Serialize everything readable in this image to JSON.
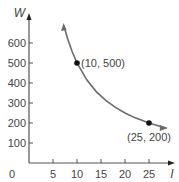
{
  "chart_data": {
    "type": "line",
    "title": "",
    "xlabel": "I",
    "ylabel": "W",
    "xlim": [
      0,
      28
    ],
    "ylim": [
      0,
      700
    ],
    "x_ticks": [
      "0",
      "5",
      "10",
      "15",
      "20",
      "25"
    ],
    "y_ticks": [
      "100",
      "200",
      "300",
      "400",
      "500",
      "600"
    ],
    "grid": false,
    "legend": null,
    "series": [
      {
        "name": "W = 5000 / I",
        "x": [
          7.3,
          8,
          9,
          10,
          12,
          14,
          16,
          18,
          20,
          22,
          25,
          28.5
        ],
        "y": [
          685,
          625,
          556,
          500,
          417,
          357,
          313,
          278,
          250,
          227,
          200,
          175
        ]
      }
    ],
    "points": [
      {
        "x": 10,
        "y": 500,
        "label": "(10, 500)"
      },
      {
        "x": 25,
        "y": 200,
        "label": "(25, 200)"
      }
    ],
    "colors": {
      "curve": "#6b6b6b",
      "axis": "#555555",
      "point": "#111111",
      "text": "#444444"
    }
  }
}
